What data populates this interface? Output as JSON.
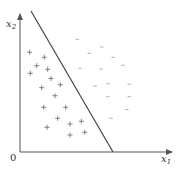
{
  "diagram": {
    "axes": {
      "x_label": "x",
      "x_subscript": "1",
      "y_label": "x",
      "y_subscript": "2",
      "origin_label": "0"
    },
    "decision_boundary": {
      "from": [
        31,
        11
      ],
      "to": [
        113,
        152
      ]
    },
    "classes": {
      "positive": {
        "symbol": "+",
        "points": [
          [
            29.7,
            52.3
          ],
          [
            44.3,
            57.3
          ],
          [
            36.7,
            65.7
          ],
          [
            47.7,
            69.3
          ],
          [
            30.3,
            73.3
          ],
          [
            51,
            78.5
          ],
          [
            41.7,
            87.7
          ],
          [
            60.3,
            84.7
          ],
          [
            55,
            95.7
          ],
          [
            43.7,
            107.3
          ],
          [
            65.7,
            107.3
          ],
          [
            57.7,
            118.3
          ],
          [
            47,
            127.3
          ],
          [
            70,
            124
          ],
          [
            81.3,
            121.3
          ],
          [
            70,
            135
          ],
          [
            84.7,
            132.3
          ]
        ]
      },
      "negative": {
        "symbol": "-",
        "points": [
          [
            77.3,
            39.3
          ],
          [
            101.7,
            47
          ],
          [
            89.3,
            53.3
          ],
          [
            113.3,
            57.3
          ],
          [
            123,
            65.3
          ],
          [
            80,
            68.3
          ],
          [
            101,
            69
          ],
          [
            108.3,
            83.8
          ],
          [
            95,
            86
          ],
          [
            129.3,
            84.2
          ],
          [
            107.7,
            96.7
          ],
          [
            129.3,
            96.7
          ],
          [
            126.7,
            109.6
          ],
          [
            111,
            118.3
          ]
        ]
      }
    },
    "colors": {
      "axis": "#555555",
      "boundary": "#444444",
      "positive": "#777777",
      "negative": "#aaaaaa"
    }
  }
}
